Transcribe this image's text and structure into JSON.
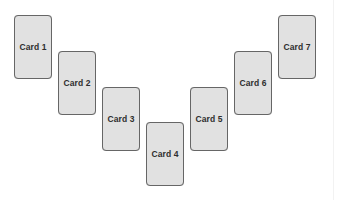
{
  "diagram": {
    "layout": "v-shape",
    "cards": [
      {
        "label": "Card 1",
        "x": 14,
        "y": 15
      },
      {
        "label": "Card 2",
        "x": 58,
        "y": 51
      },
      {
        "label": "Card 3",
        "x": 102,
        "y": 87
      },
      {
        "label": "Card 4",
        "x": 146,
        "y": 122
      },
      {
        "label": "Card 5",
        "x": 190,
        "y": 87
      },
      {
        "label": "Card 6",
        "x": 234,
        "y": 51
      },
      {
        "label": "Card 7",
        "x": 278,
        "y": 15
      }
    ],
    "colors": {
      "card_fill": "#e1e1e1",
      "card_border": "#666666",
      "label_text": "#2e2e2e",
      "background": "#ffffff"
    }
  }
}
